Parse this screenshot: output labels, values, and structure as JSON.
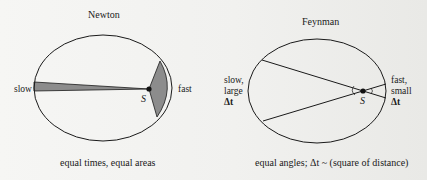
{
  "panels": {
    "newton": {
      "title": "Newton",
      "left_label": "slow",
      "right_label": "fast",
      "sun_label": "S",
      "caption": "equal times, equal areas"
    },
    "feynman": {
      "title": "Feynman",
      "left_label_line1": "slow,",
      "left_label_line2": "large",
      "left_label_line3": "Δt",
      "right_label_line1": "fast,",
      "right_label_line2": "small",
      "right_label_line3": "Δt",
      "sun_label": "S",
      "caption": "equal angles; Δt ~ (square of distance)"
    }
  },
  "colors": {
    "ink": "#1a1a1a",
    "shade": "#8c8c8c",
    "background": "#f3f3f1"
  }
}
